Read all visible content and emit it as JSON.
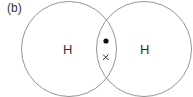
{
  "figure": {
    "panel_label": "(b)",
    "atoms": [
      {
        "symbol": "H",
        "cx": 69,
        "cy": 49,
        "r": 48
      },
      {
        "symbol": "H",
        "cx": 144,
        "cy": 49,
        "r": 48
      }
    ],
    "shared_electrons": [
      {
        "kind": "dot",
        "symbol": "●"
      },
      {
        "kind": "cross",
        "symbol": "×"
      }
    ],
    "colors": {
      "stroke": "#888888",
      "text": "#333333"
    }
  }
}
